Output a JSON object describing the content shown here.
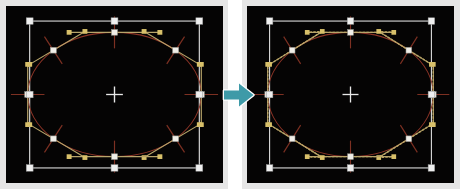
{
  "figure": {
    "type": "before-after-comparison",
    "background_color": "#ffffff"
  },
  "arrow": {
    "name": "transform-arrow",
    "direction": "right",
    "color": "#3e9aa8",
    "outline_color": "#ffffff"
  },
  "panels": [
    {
      "id": "before",
      "label": "Before",
      "canvas_background": "#050404",
      "frame_color": "#e6e6e6",
      "show_control_polygon": false,
      "bounds": {
        "x": 0,
        "y": 0,
        "width": 229,
        "height": 189
      },
      "canvas": {
        "x": 6,
        "y": 6,
        "width": 217,
        "height": 177
      }
    },
    {
      "id": "after",
      "label": "After",
      "canvas_background": "#050404",
      "frame_color": "#e6e6e6",
      "show_control_polygon": true,
      "bounds": {
        "x": 241,
        "y": 0,
        "width": 219,
        "height": 189
      },
      "canvas": {
        "x": 6,
        "y": 6,
        "width": 207,
        "height": 177
      }
    }
  ],
  "shape": {
    "name": "ellipse-path",
    "stroke_color": "#8a3326",
    "stroke_width": 1.1,
    "center": {
      "x": 110,
      "y": 94
    },
    "radius_x": 88,
    "radius_y": 66,
    "closed": true,
    "node_count": 8
  },
  "selection": {
    "name": "selection-bounding-box",
    "stroke_color": "#d6d6d6",
    "handle_fill": "#efefef",
    "handle_size": 7,
    "handle_count": 8,
    "box": {
      "x": 24,
      "y": 16,
      "width": 172,
      "height": 156
    }
  },
  "center_marker": {
    "name": "center-crosshair",
    "color": "#e8e8e8",
    "size": 17
  },
  "control_points": {
    "anchor_fill": "#f0eee8",
    "anchor_size": 6,
    "handle_fill": "#d8c06a",
    "handle_size": 5,
    "tangent_line_color": "#b8a46a",
    "cross_line_color": "#7d3022",
    "polygon_dash_color": "#c0a85e",
    "polygon_dash_pattern": "1 3",
    "count": 8
  },
  "nodes": [
    {
      "index": 0,
      "anchor": {
        "x": 110,
        "y": 28
      },
      "handle_in": {
        "x": 64,
        "y": 28
      },
      "handle_out": {
        "x": 156,
        "y": 28
      }
    },
    {
      "index": 1,
      "anchor": {
        "x": 172,
        "y": 47
      },
      "handle_in": {
        "x": 140,
        "y": 27
      },
      "handle_out": {
        "x": 196,
        "y": 62
      }
    },
    {
      "index": 2,
      "anchor": {
        "x": 198,
        "y": 94
      },
      "handle_in": {
        "x": 198,
        "y": 62
      },
      "handle_out": {
        "x": 198,
        "y": 126
      }
    },
    {
      "index": 3,
      "anchor": {
        "x": 172,
        "y": 141
      },
      "handle_in": {
        "x": 196,
        "y": 126
      },
      "handle_out": {
        "x": 140,
        "y": 161
      }
    },
    {
      "index": 4,
      "anchor": {
        "x": 110,
        "y": 160
      },
      "handle_in": {
        "x": 156,
        "y": 160
      },
      "handle_out": {
        "x": 64,
        "y": 160
      }
    },
    {
      "index": 5,
      "anchor": {
        "x": 48,
        "y": 141
      },
      "handle_in": {
        "x": 80,
        "y": 161
      },
      "handle_out": {
        "x": 24,
        "y": 126
      }
    },
    {
      "index": 6,
      "anchor": {
        "x": 22,
        "y": 94
      },
      "handle_in": {
        "x": 22,
        "y": 126
      },
      "handle_out": {
        "x": 22,
        "y": 62
      }
    },
    {
      "index": 7,
      "anchor": {
        "x": 48,
        "y": 47
      },
      "handle_in": {
        "x": 24,
        "y": 62
      },
      "handle_out": {
        "x": 80,
        "y": 27
      }
    }
  ]
}
